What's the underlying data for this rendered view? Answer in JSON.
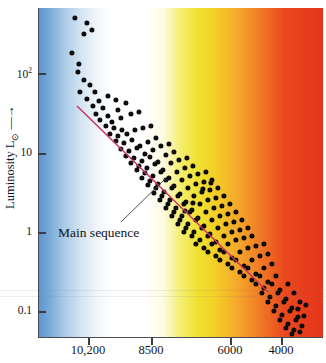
{
  "figure": {
    "name": "hertzsprung-russell-diagram",
    "background": "#ffffff"
  },
  "axes": {
    "y": {
      "label": "Luminosity L",
      "label_sub": "⊙",
      "label_arrow": "—→",
      "scale": "log",
      "ticks": [
        {
          "value": 100,
          "text": "10",
          "exp": "2",
          "y": 73
        },
        {
          "value": 10,
          "text": "10",
          "exp": "",
          "y": 153
        },
        {
          "value": 1,
          "text": "1",
          "exp": "",
          "y": 232
        },
        {
          "value": 0.1,
          "text": "0.1",
          "exp": "",
          "y": 311
        }
      ]
    },
    "x": {
      "label": "",
      "scale": "linear-reversed-temperature",
      "ticks": [
        {
          "value": 10200,
          "text": "10,200",
          "x": 88
        },
        {
          "value": 8500,
          "text": "8500",
          "x": 151
        },
        {
          "value": 6000,
          "text": "6000",
          "x": 230
        },
        {
          "value": 4000,
          "text": "4000",
          "x": 281
        }
      ]
    }
  },
  "spectrum": {
    "description": "stellar color temperature band",
    "stops": [
      {
        "pos": 0,
        "color": "#5a93cf"
      },
      {
        "pos": 4,
        "color": "#78a9d8"
      },
      {
        "pos": 9,
        "color": "#a8c9e6"
      },
      {
        "pos": 15,
        "color": "#d4e4f2"
      },
      {
        "pos": 21,
        "color": "#f2f6fa"
      },
      {
        "pos": 26,
        "color": "#ffffff"
      },
      {
        "pos": 38,
        "color": "#ffffff"
      },
      {
        "pos": 44,
        "color": "#fdfbe0"
      },
      {
        "pos": 50,
        "color": "#f5ee70"
      },
      {
        "pos": 56,
        "color": "#efe232"
      },
      {
        "pos": 62,
        "color": "#f3cf28"
      },
      {
        "pos": 70,
        "color": "#f4a82a"
      },
      {
        "pos": 78,
        "color": "#f07a26"
      },
      {
        "pos": 86,
        "color": "#ea4a1f"
      },
      {
        "pos": 94,
        "color": "#e63c1c"
      },
      {
        "pos": 100,
        "color": "#e5371b"
      }
    ]
  },
  "main_sequence": {
    "annotation_label": "Main sequence",
    "line_color": "#cc3366",
    "fit_line": {
      "x1": 77,
      "y1": 106,
      "x2": 268,
      "y2": 292
    },
    "leader_line": {
      "x1": 121,
      "y1": 222,
      "x2": 167,
      "y2": 177
    }
  },
  "chart_data": {
    "type": "scatter",
    "title": "",
    "xlabel": "Surface temperature (K)",
    "ylabel": "Luminosity L⊙",
    "xlim": [
      11000,
      2800
    ],
    "ylim": [
      0.07,
      600
    ],
    "xscale": "linear",
    "yscale": "log",
    "grid": false,
    "legend": null,
    "series": [
      {
        "name": "stars",
        "marker": "filled-circle",
        "color": "#0d0d0d",
        "points_px": [
          [
            75,
            18
          ],
          [
            87,
            23
          ],
          [
            84,
            34
          ],
          [
            92,
            30
          ],
          [
            72,
            53
          ],
          [
            79,
            64
          ],
          [
            78,
            72
          ],
          [
            84,
            80
          ],
          [
            90,
            85
          ],
          [
            80,
            92
          ],
          [
            95,
            92
          ],
          [
            87,
            99
          ],
          [
            99,
            101
          ],
          [
            108,
            96
          ],
          [
            116,
            100
          ],
          [
            93,
            106
          ],
          [
            103,
            108
          ],
          [
            118,
            110
          ],
          [
            126,
            103
          ],
          [
            96,
            114
          ],
          [
            108,
            116
          ],
          [
            100,
            120
          ],
          [
            112,
            122
          ],
          [
            121,
            118
          ],
          [
            131,
            114
          ],
          [
            139,
            112
          ],
          [
            106,
            126
          ],
          [
            114,
            128
          ],
          [
            122,
            130
          ],
          [
            110,
            134
          ],
          [
            118,
            136
          ],
          [
            127,
            134
          ],
          [
            135,
            130
          ],
          [
            143,
            128
          ],
          [
            151,
            126
          ],
          [
            116,
            141
          ],
          [
            124,
            143
          ],
          [
            132,
            140
          ],
          [
            140,
            146
          ],
          [
            148,
            142
          ],
          [
            156,
            138
          ],
          [
            121,
            149
          ],
          [
            129,
            151
          ],
          [
            137,
            148
          ],
          [
            145,
            154
          ],
          [
            153,
            150
          ],
          [
            161,
            146
          ],
          [
            169,
            144
          ],
          [
            126,
            156
          ],
          [
            134,
            158
          ],
          [
            142,
            161
          ],
          [
            150,
            157
          ],
          [
            158,
            162
          ],
          [
            166,
            155
          ],
          [
            174,
            152
          ],
          [
            131,
            163
          ],
          [
            139,
            166
          ],
          [
            147,
            168
          ],
          [
            155,
            164
          ],
          [
            163,
            170
          ],
          [
            171,
            163
          ],
          [
            179,
            160
          ],
          [
            187,
            158
          ],
          [
            137,
            170
          ],
          [
            145,
            173
          ],
          [
            153,
            176
          ],
          [
            161,
            172
          ],
          [
            169,
            178
          ],
          [
            177,
            172
          ],
          [
            185,
            168
          ],
          [
            193,
            166
          ],
          [
            142,
            178
          ],
          [
            150,
            181
          ],
          [
            158,
            184
          ],
          [
            166,
            180
          ],
          [
            174,
            186
          ],
          [
            182,
            180
          ],
          [
            190,
            176
          ],
          [
            198,
            174
          ],
          [
            206,
            172
          ],
          [
            148,
            185
          ],
          [
            156,
            188
          ],
          [
            164,
            192
          ],
          [
            172,
            188
          ],
          [
            180,
            194
          ],
          [
            188,
            188
          ],
          [
            196,
            184
          ],
          [
            204,
            182
          ],
          [
            212,
            180
          ],
          [
            154,
            193
          ],
          [
            162,
            196
          ],
          [
            170,
            200
          ],
          [
            178,
            196
          ],
          [
            186,
            202
          ],
          [
            194,
            196
          ],
          [
            202,
            192
          ],
          [
            210,
            190
          ],
          [
            218,
            188
          ],
          [
            160,
            200
          ],
          [
            168,
            204
          ],
          [
            176,
            208
          ],
          [
            184,
            204
          ],
          [
            192,
            210
          ],
          [
            200,
            204
          ],
          [
            208,
            200
          ],
          [
            216,
            198
          ],
          [
            224,
            196
          ],
          [
            166,
            208
          ],
          [
            174,
            212
          ],
          [
            182,
            216
          ],
          [
            190,
            212
          ],
          [
            198,
            218
          ],
          [
            206,
            212
          ],
          [
            214,
            208
          ],
          [
            222,
            206
          ],
          [
            230,
            204
          ],
          [
            172,
            216
          ],
          [
            180,
            220
          ],
          [
            188,
            224
          ],
          [
            196,
            220
          ],
          [
            204,
            226
          ],
          [
            212,
            220
          ],
          [
            220,
            216
          ],
          [
            228,
            214
          ],
          [
            236,
            212
          ],
          [
            178,
            224
          ],
          [
            186,
            228
          ],
          [
            194,
            232
          ],
          [
            202,
            228
          ],
          [
            210,
            234
          ],
          [
            218,
            228
          ],
          [
            226,
            224
          ],
          [
            234,
            222
          ],
          [
            242,
            220
          ],
          [
            184,
            232
          ],
          [
            192,
            236
          ],
          [
            200,
            240
          ],
          [
            208,
            236
          ],
          [
            216,
            242
          ],
          [
            224,
            236
          ],
          [
            232,
            232
          ],
          [
            240,
            230
          ],
          [
            248,
            228
          ],
          [
            196,
            244
          ],
          [
            204,
            248
          ],
          [
            212,
            244
          ],
          [
            220,
            250
          ],
          [
            228,
            244
          ],
          [
            236,
            240
          ],
          [
            244,
            238
          ],
          [
            252,
            236
          ],
          [
            208,
            252
          ],
          [
            216,
            256
          ],
          [
            224,
            252
          ],
          [
            232,
            258
          ],
          [
            240,
            252
          ],
          [
            248,
            248
          ],
          [
            256,
            246
          ],
          [
            264,
            244
          ],
          [
            220,
            260
          ],
          [
            228,
            264
          ],
          [
            236,
            260
          ],
          [
            244,
            266
          ],
          [
            252,
            260
          ],
          [
            260,
            256
          ],
          [
            268,
            254
          ],
          [
            232,
            268
          ],
          [
            240,
            272
          ],
          [
            248,
            268
          ],
          [
            256,
            274
          ],
          [
            264,
            268
          ],
          [
            272,
            264
          ],
          [
            244,
            276
          ],
          [
            252,
            280
          ],
          [
            260,
            276
          ],
          [
            268,
            282
          ],
          [
            276,
            276
          ],
          [
            256,
            284
          ],
          [
            264,
            288
          ],
          [
            272,
            284
          ],
          [
            280,
            290
          ],
          [
            288,
            284
          ],
          [
            262,
            293
          ],
          [
            270,
            297
          ],
          [
            278,
            293
          ],
          [
            286,
            299
          ],
          [
            294,
            293
          ],
          [
            268,
            302
          ],
          [
            276,
            306
          ],
          [
            284,
            302
          ],
          [
            292,
            308
          ],
          [
            300,
            302
          ],
          [
            274,
            311
          ],
          [
            282,
            315
          ],
          [
            290,
            311
          ],
          [
            298,
            317
          ],
          [
            280,
            320
          ],
          [
            288,
            324
          ],
          [
            296,
            320
          ],
          [
            304,
            316
          ],
          [
            286,
            328
          ],
          [
            294,
            330
          ],
          [
            302,
            326
          ],
          [
            292,
            334
          ],
          [
            300,
            332
          ],
          [
            298,
            309
          ],
          [
            306,
            305
          ],
          [
            203,
            189
          ],
          [
            211,
            183
          ],
          [
            193,
            203
          ],
          [
            185,
            211
          ]
        ]
      }
    ],
    "annotations": [
      {
        "text": "Main sequence",
        "x_px": 58,
        "y_px": 226,
        "type": "label-with-leader"
      }
    ]
  }
}
